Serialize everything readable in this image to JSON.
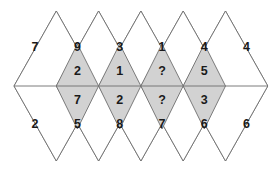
{
  "figure": {
    "colors": {
      "shaded_fill": "#d2d2d2",
      "plain_fill": "#ffffff",
      "stroke": "#6e6e6e",
      "text": "#1a1a1a"
    },
    "geometry": {
      "width": 280,
      "height": 172,
      "center_y": 86,
      "top_peak_y": 11,
      "bottom_peak_y": 162,
      "shaded_top_y": 44,
      "shaded_bottom_y": 129,
      "lattice_x": [
        14,
        56.3,
        98.6,
        140.9,
        183.2,
        225.5,
        267.8
      ]
    }
  },
  "rows": {
    "top": {
      "name": "upper-row",
      "shaded": false,
      "cells": [
        {
          "value": "7",
          "cx": 35.1
        },
        {
          "value": "9",
          "cx": 77.4
        },
        {
          "value": "3",
          "cx": 119.7
        },
        {
          "value": "1",
          "cx": 162.0
        },
        {
          "value": "4",
          "cx": 204.3
        }
      ]
    },
    "middle_upper": {
      "name": "middle-upper-row",
      "shaded": true,
      "cells": [
        {
          "value": "2",
          "cx": 77.4
        },
        {
          "value": "1",
          "cx": 119.7
        },
        {
          "value": "?",
          "cx": 162.0
        },
        {
          "value": "5",
          "cx": 204.3
        }
      ]
    },
    "middle_lower": {
      "name": "middle-lower-row",
      "shaded": true,
      "cells": [
        {
          "value": "7",
          "cx": 77.4
        },
        {
          "value": "2",
          "cx": 119.7
        },
        {
          "value": "?",
          "cx": 162.0
        },
        {
          "value": "3",
          "cx": 204.3
        }
      ]
    },
    "bottom": {
      "name": "lower-row",
      "shaded": false,
      "cells": [
        {
          "value": "2",
          "cx": 35.1
        },
        {
          "value": "5",
          "cx": 77.4
        },
        {
          "value": "8",
          "cx": 119.7
        },
        {
          "value": "7",
          "cx": 162.0
        },
        {
          "value": "6",
          "cx": 204.3
        }
      ]
    },
    "right_edge": {
      "name": "right-edge-row",
      "shaded": false,
      "cells": [
        {
          "value": "4",
          "cx": 246.6,
          "position": "top"
        },
        {
          "value": "6",
          "cx": 246.6,
          "position": "bottom"
        }
      ]
    }
  },
  "labels": {
    "top_row_values": [
      "7",
      "9",
      "3",
      "1",
      "4"
    ],
    "middle_upper_values": [
      "2",
      "1",
      "?",
      "5"
    ],
    "middle_lower_values": [
      "7",
      "2",
      "?",
      "3"
    ],
    "bottom_row_values": [
      "2",
      "5",
      "8",
      "7",
      "6"
    ],
    "unknown_marker": "?"
  }
}
